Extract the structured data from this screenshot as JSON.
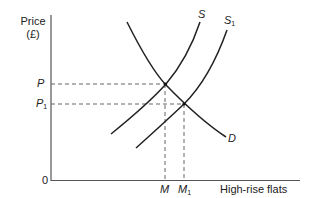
{
  "diagram": {
    "y_axis": {
      "label_line1": "Price",
      "label_line2": "(£)"
    },
    "x_axis": {
      "label": "High-rise flats"
    },
    "origin_label": "0",
    "price_levels": [
      {
        "name": "P",
        "sub": ""
      },
      {
        "name": "P",
        "sub": "1"
      }
    ],
    "quantity_levels": [
      {
        "name": "M",
        "sub": ""
      },
      {
        "name": "M",
        "sub": "1"
      }
    ],
    "curves": [
      {
        "name": "S",
        "sub": "",
        "type": "supply"
      },
      {
        "name": "S",
        "sub": "1",
        "type": "supply-shifted"
      },
      {
        "name": "D",
        "sub": "",
        "type": "demand"
      }
    ],
    "equilibria": [
      {
        "price": "P",
        "quantity": "M",
        "curves": [
          "S",
          "D"
        ]
      },
      {
        "price": "P1",
        "quantity": "M1",
        "curves": [
          "S1",
          "D"
        ]
      }
    ],
    "colors": {
      "line": "#222222",
      "axis": "#555555",
      "dashed": "#666666"
    }
  }
}
